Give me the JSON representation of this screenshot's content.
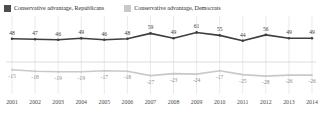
{
  "legend": {
    "items": [
      {
        "label": "Conservative advantage, Republicans",
        "color": "#4d4d4d",
        "key": "republicans"
      },
      {
        "label": "Conservative advantage, Democrats",
        "color": "#c9c9c9",
        "key": "democrats"
      }
    ]
  },
  "chart_data": {
    "type": "line",
    "title": "",
    "xlabel": "",
    "ylabel": "",
    "grid": true,
    "legend_position": "top-left",
    "ylim": [
      -40,
      70
    ],
    "categories": [
      "2001",
      "2002",
      "2003",
      "2004",
      "2005",
      "2006",
      "2007",
      "2008",
      "2009",
      "2010",
      "2011",
      "2012",
      "2013",
      "2014"
    ],
    "series": [
      {
        "name": "Conservative advantage, Republicans",
        "color": "#4d4d4d",
        "values": [
          48,
          47,
          46,
          49,
          46,
          48,
          59,
          49,
          61,
          55,
          44,
          56,
          49,
          49
        ]
      },
      {
        "name": "Conservative advantage, Democrats",
        "color": "#c9c9c9",
        "values": [
          -15,
          -18,
          -19,
          -19,
          -17,
          -18,
          -27,
          -23,
          -24,
          -17,
          -25,
          -28,
          -26,
          -26
        ]
      }
    ]
  }
}
